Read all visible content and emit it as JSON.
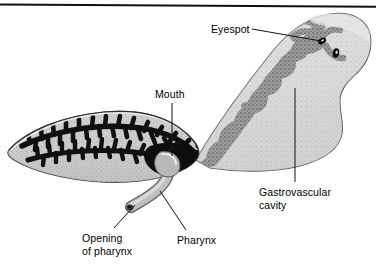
{
  "figure": {
    "rule": {
      "visible": true,
      "color": "#101010"
    },
    "background_color": "#ffffff",
    "ink_color": "#000000",
    "body_fill": "#d9d9d9",
    "body_light_fill": "#e8e8e8",
    "cavity_fill": "#9a9a9a",
    "cavity_dark_fill": "#141414",
    "outline_color": "#3a3a3a"
  },
  "labels": [
    {
      "id": "eyespot",
      "text": "Eyespot",
      "lines": [
        "Eyespot"
      ],
      "leader": {
        "type": "straight",
        "from": [
          252,
          29
        ],
        "to": [
          321,
          41
        ]
      }
    },
    {
      "id": "mouth",
      "text": "Mouth",
      "lines": [
        "Mouth"
      ],
      "leader": {
        "type": "vertical",
        "from": [
          172,
          103
        ],
        "to": [
          172,
          156
        ]
      }
    },
    {
      "id": "gastrovascular_cavity",
      "text": "Gastrovascular cavity",
      "lines": [
        "Gastrovascular",
        "cavity"
      ],
      "leader": {
        "type": "vertical",
        "from": [
          295,
          88
        ],
        "to": [
          295,
          182
        ]
      }
    },
    {
      "id": "opening_of_pharynx",
      "text": "Opening of pharynx",
      "lines": [
        "Opening",
        "of pharynx"
      ],
      "leader": {
        "type": "straight",
        "from": [
          114,
          228
        ],
        "to": [
          134,
          206
        ]
      }
    },
    {
      "id": "pharynx",
      "text": "Pharynx",
      "lines": [
        "Pharynx"
      ],
      "leader": {
        "type": "straight",
        "from": [
          186,
          230
        ],
        "to": [
          160,
          192
        ]
      }
    }
  ],
  "anatomy": {
    "eyespots": [
      {
        "cx": 322,
        "cy": 41,
        "rx": 4.2,
        "ry": 2.8,
        "rotate": -28
      },
      {
        "cx": 336,
        "cy": 53,
        "rx": 3.2,
        "ry": 4.6,
        "rotate": 10
      }
    ],
    "regions": [
      {
        "name": "posterior-body",
        "description": "light grey body with branched grey gastrovascular cavity"
      },
      {
        "name": "anterior-lobe",
        "description": "grey lobe with two black branched intestinal trunks"
      },
      {
        "name": "pharynx-tube",
        "description": "grey muscular tube projecting ventrally from the mouth"
      }
    ]
  }
}
